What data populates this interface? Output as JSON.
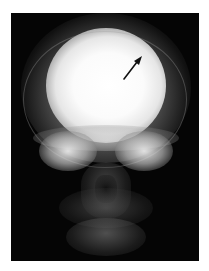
{
  "image": {
    "subject": "frontal skull radiograph",
    "background_color": "#ffffff",
    "film_color": "#050505",
    "annotation": {
      "type": "arrow",
      "color": "#111111",
      "direction": "up-right",
      "points_to": "upper right cranial vault"
    }
  }
}
